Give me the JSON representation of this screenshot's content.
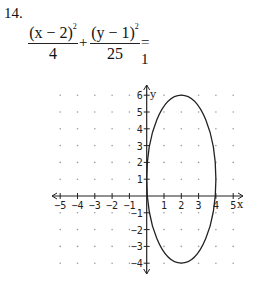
{
  "problem": {
    "number": "14.",
    "equation": {
      "term1_numerator": "(x − 2)",
      "term1_exponent": "2",
      "term1_denominator": "4",
      "plus": "+",
      "term2_numerator": "(y − 1)",
      "term2_exponent": "2",
      "term2_denominator": "25",
      "equals": "= 1"
    }
  },
  "graph": {
    "x_axis_label": "x",
    "y_axis_label": "y",
    "x_ticks": [
      "-5",
      "-4",
      "-3",
      "-2",
      "-1",
      "1",
      "2",
      "3",
      "4",
      "5"
    ],
    "y_ticks": [
      "6",
      "5",
      "4",
      "3",
      "2",
      "1",
      "-1",
      "-2",
      "-3",
      "-4"
    ],
    "ellipse": {
      "center_x": 2,
      "center_y": 1,
      "radius_x": 2,
      "radius_y": 5
    },
    "x_range": [
      -5,
      5
    ],
    "y_range": [
      -4,
      6
    ]
  },
  "chart_data": {
    "type": "line",
    "xlabel": "x",
    "ylabel": "y",
    "xlim": [
      -5.5,
      5.5
    ],
    "ylim": [
      -4.5,
      6.5
    ],
    "grid": "dotted points at integer coordinates",
    "series": [
      {
        "name": "ellipse",
        "shape": "ellipse",
        "center": [
          2,
          1
        ],
        "semi_axis_x": 2,
        "semi_axis_y": 5,
        "vertices": [
          [
            2,
            6
          ],
          [
            2,
            -4
          ]
        ],
        "co_vertices": [
          [
            0,
            1
          ],
          [
            4,
            1
          ]
        ]
      }
    ],
    "x_ticks": [
      -5,
      -4,
      -3,
      -2,
      -1,
      1,
      2,
      3,
      4,
      5
    ],
    "y_ticks": [
      -4,
      -3,
      -2,
      -1,
      1,
      2,
      3,
      4,
      5,
      6
    ]
  }
}
